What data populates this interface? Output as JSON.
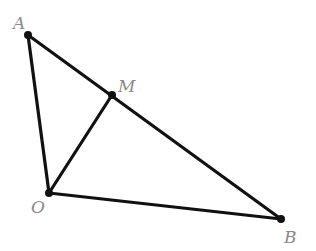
{
  "diagram": {
    "type": "geometry",
    "colors": {
      "line": "#111111",
      "label": "#8a8a8a",
      "background": "#ffffff"
    },
    "points": [
      {
        "id": "A",
        "label": "A",
        "x": 28,
        "y": 35,
        "label_x": 13,
        "label_y": 29
      },
      {
        "id": "M",
        "label": "M",
        "x": 112,
        "y": 95,
        "label_x": 118,
        "label_y": 92
      },
      {
        "id": "O",
        "label": "O",
        "x": 49,
        "y": 193,
        "label_x": 31,
        "label_y": 213
      },
      {
        "id": "B",
        "label": "B",
        "x": 281,
        "y": 219,
        "label_x": 284,
        "label_y": 243
      }
    ],
    "segments": [
      {
        "from": "A",
        "to": "B"
      },
      {
        "from": "A",
        "to": "O"
      },
      {
        "from": "O",
        "to": "B"
      },
      {
        "from": "O",
        "to": "M"
      }
    ]
  }
}
